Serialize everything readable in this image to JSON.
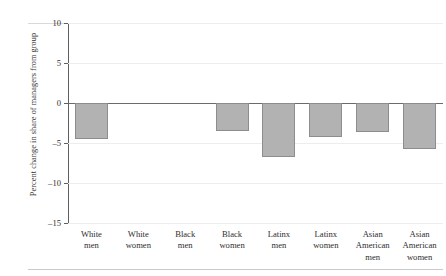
{
  "chart_data": {
    "type": "bar",
    "title": "",
    "subtitle": "",
    "xlabel": "",
    "ylabel": "Percent change in share of managers from group",
    "categories": [
      "White men",
      "White women",
      "Black men",
      "Black women",
      "Latinx men",
      "Latinx women",
      "Asian American men",
      "Asian American women"
    ],
    "category_lines": [
      [
        "White",
        "men"
      ],
      [
        "White",
        "women"
      ],
      [
        "Black",
        "men"
      ],
      [
        "Black",
        "women"
      ],
      [
        "Latinx",
        "men"
      ],
      [
        "Latinx",
        "women"
      ],
      [
        "Asian",
        "American",
        "men"
      ],
      [
        "Asian",
        "American",
        "women"
      ]
    ],
    "values": [
      -4.5,
      0,
      0,
      -3.5,
      -6.8,
      -4.2,
      -3.6,
      -5.7
    ],
    "ylim": [
      -15,
      10
    ],
    "yticks": [
      10,
      5,
      0,
      -5,
      -10,
      -15
    ],
    "ytick_labels": [
      "10",
      "5",
      "0",
      "–5",
      "–10",
      "–15"
    ],
    "grid": true,
    "grid_axis": "y",
    "legend": "none",
    "bar_color": "#b2b2b2",
    "bar_edge_color": "#8d8d8d",
    "zero_line_color": "#6a6a6a",
    "axis_color": "#5f5f5f",
    "grid_color": "#ededed",
    "background": "#ffffff"
  }
}
